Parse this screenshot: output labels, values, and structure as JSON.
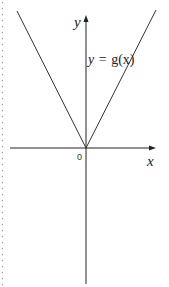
{
  "figure": {
    "type": "function-graph",
    "function_label": "y = g(x)",
    "function_label_parts": {
      "lhs": "y",
      "eq": "=",
      "rhs": "g(x)"
    },
    "x_axis_label": "x",
    "y_axis_label": "y",
    "origin_label": "0",
    "shape": "V-shaped absolute-value style graph with vertex at origin",
    "line_color": "#333333",
    "axis_color": "#222222",
    "margin_rule": "dotted"
  }
}
